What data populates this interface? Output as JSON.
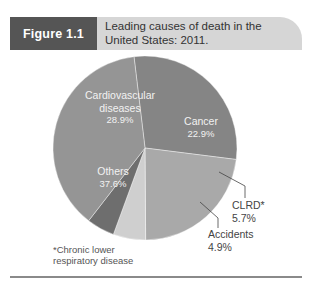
{
  "figure": {
    "label": "Figure 1.1",
    "title_line1": "Leading causes of death in the",
    "title_line2": "United States: 2011."
  },
  "chart_data": {
    "type": "pie",
    "title": "Leading causes of death in the United States: 2011.",
    "categories": [
      "Cardiovascular diseases",
      "Cancer",
      "CLRD*",
      "Accidents",
      "Others"
    ],
    "values": [
      28.9,
      22.9,
      5.7,
      4.9,
      37.6
    ],
    "unit": "%",
    "colors": [
      "#858585",
      "#a9a9a9",
      "#cfcfcf",
      "#6e6e6e",
      "#959595"
    ],
    "footnote": "*Chronic lower respiratory disease",
    "legend": "none (direct labels)"
  },
  "labels": {
    "cardio_name_1": "Cardiovascular",
    "cardio_name_2": "diseases",
    "cardio_value": "28.9%",
    "cancer_name": "Cancer",
    "cancer_value": "22.9%",
    "others_name": "Others",
    "others_value": "37.6%",
    "clrd_name": "CLRD*",
    "clrd_value": "5.7%",
    "accidents_name": "Accidents",
    "accidents_value": "4.9%"
  },
  "footnote": {
    "line1": "*Chronic lower",
    "line2": " respiratory disease"
  }
}
